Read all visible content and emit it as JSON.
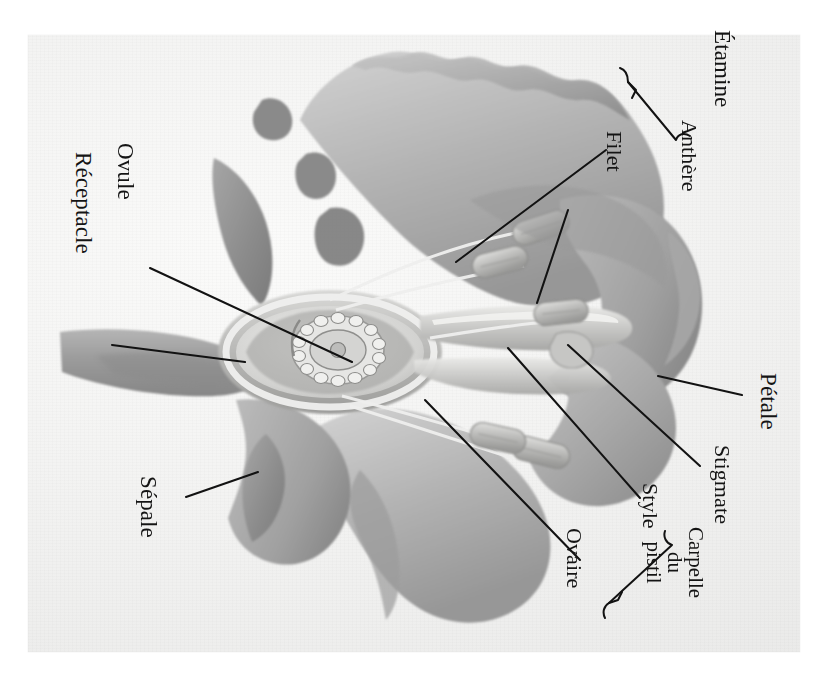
{
  "figure": {
    "kind": "botanical-diagram",
    "language": "fr",
    "orientation": "labels-rotated-90-clockwise",
    "background_color": "#f3f3f2",
    "ink_color": "#141414",
    "artwork_palette": {
      "petal_light": "#c9c9c9",
      "petal_mid": "#a9a9a9",
      "petal_dark": "#8a8a8a",
      "sepal_dark": "#8f8f8f",
      "stem_mid": "#9e9e9e",
      "ovary_wall": "#b4b4b4",
      "ovary_inner": "#e2e2e0",
      "highlight": "#efefee"
    }
  },
  "labels": {
    "etamine": "Étamine",
    "anthere": "Anthère",
    "filet": "Filet",
    "petale": "Pétale",
    "stigmate": "Stigmate",
    "style": "Style",
    "ovaire": "Ovaire",
    "ovule": "Ovule",
    "receptacle": "Réceptacle",
    "sepale": "Sépale",
    "carpelle_l1": "Carpelle",
    "carpelle_l2": "du",
    "carpelle_l3": "pistil"
  },
  "groups": {
    "etamine_members": [
      "Anthère",
      "Filet"
    ],
    "carpelle_members": [
      "Stigmate",
      "Style",
      "Ovaire"
    ]
  },
  "leader_lines": [
    {
      "label": "Ovule",
      "from": [
        150,
        268
      ],
      "to": [
        352,
        362
      ]
    },
    {
      "label": "Réceptacle",
      "from": [
        112,
        345
      ],
      "to": [
        245,
        362
      ]
    },
    {
      "label": "Sépale",
      "from": [
        186,
        497
      ],
      "to": [
        258,
        472
      ]
    },
    {
      "label": "Filet",
      "from": [
        606,
        150
      ],
      "to": [
        456,
        262
      ]
    },
    {
      "label": "Anthère",
      "from": [
        568,
        210
      ],
      "to": [
        537,
        303
      ]
    },
    {
      "label": "Pétale",
      "from": [
        742,
        395
      ],
      "to": [
        658,
        376
      ]
    },
    {
      "label": "Stigmate",
      "from": [
        700,
        466
      ],
      "to": [
        568,
        345
      ]
    },
    {
      "label": "Style",
      "from": [
        640,
        498
      ],
      "to": [
        508,
        348
      ]
    },
    {
      "label": "Ovaire",
      "from": [
        580,
        560
      ],
      "to": [
        425,
        400
      ]
    }
  ]
}
